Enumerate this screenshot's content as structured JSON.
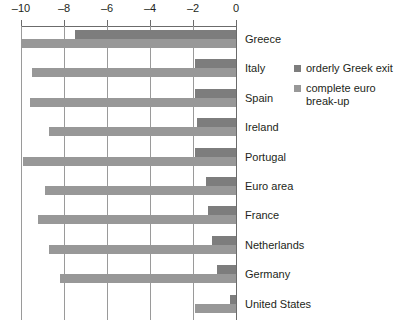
{
  "chart_data": {
    "type": "bar",
    "orientation": "horizontal",
    "title": "",
    "subtitle": "",
    "xlabel": "",
    "ylabel": "",
    "xlim": [
      -10,
      0
    ],
    "xticks": [
      -10,
      -8,
      -6,
      -4,
      -2,
      0
    ],
    "xtick_labels": [
      "–10",
      "–8",
      "–6",
      "–4",
      "–2",
      "0"
    ],
    "grid": true,
    "grid_axis": "x",
    "legend_position": "right",
    "categories": [
      "Greece",
      "Italy",
      "Spain",
      "Ireland",
      "Portugal",
      "Euro area",
      "France",
      "Netherlands",
      "Germany",
      "United States"
    ],
    "series": [
      {
        "name": "orderly Greek exit",
        "color": "#7d7d7d",
        "values": [
          -7.5,
          -1.9,
          -1.9,
          -1.8,
          -1.9,
          -1.4,
          -1.3,
          -1.1,
          -0.9,
          -0.3
        ]
      },
      {
        "name": "complete euro break-up",
        "color": "#989898",
        "values": [
          -10.0,
          -9.5,
          -9.6,
          -8.7,
          -9.9,
          -8.9,
          -9.2,
          -8.7,
          -8.2,
          -1.9
        ]
      }
    ]
  },
  "legend": {
    "items": [
      {
        "label": "orderly Greek exit",
        "color": "#7d7d7d"
      },
      {
        "label": "complete euro break-up",
        "color": "#989898"
      }
    ]
  },
  "colors": {
    "orderly": "#7d7d7d",
    "breakup": "#989898",
    "axis": "#6b6b6b",
    "grid": "#9a9a9a",
    "text": "#231f20",
    "background": "#ffffff"
  }
}
